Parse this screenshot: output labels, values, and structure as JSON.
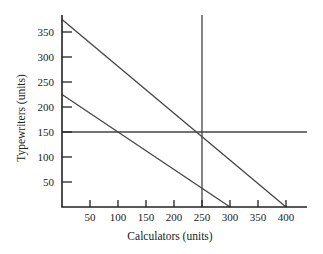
{
  "chart_data": {
    "type": "line",
    "title": "",
    "xlabel": "Calculators (units)",
    "ylabel": "Typewriters (units)",
    "xlim": [
      0,
      430
    ],
    "ylim": [
      0,
      380
    ],
    "x_ticks": [
      50,
      100,
      150,
      200,
      250,
      300,
      350,
      400
    ],
    "y_ticks": [
      50,
      100,
      150,
      200,
      250,
      300,
      350
    ],
    "grid": false,
    "legend": null,
    "series": [
      {
        "name": "Budget line 1",
        "points": [
          [
            0,
            375
          ],
          [
            400,
            0
          ]
        ]
      },
      {
        "name": "Budget line 2",
        "points": [
          [
            0,
            225
          ],
          [
            300,
            0
          ]
        ]
      },
      {
        "name": "Horizontal reference (150 typewriters)",
        "points": [
          [
            0,
            150
          ],
          [
            430,
            150
          ]
        ]
      },
      {
        "name": "Vertical reference (250 calculators)",
        "points": [
          [
            250,
            0
          ],
          [
            250,
            380
          ]
        ]
      }
    ]
  },
  "colors": {
    "axis": "#222222",
    "line": "#444444"
  }
}
